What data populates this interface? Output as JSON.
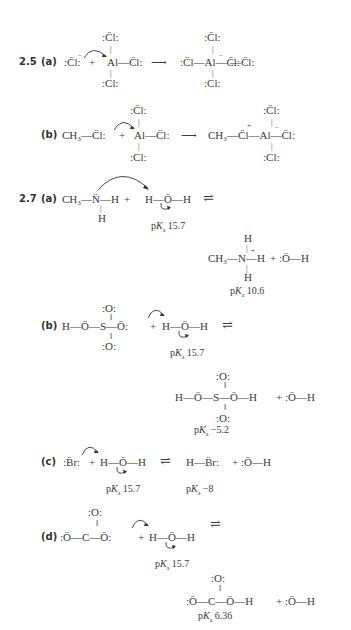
{
  "problems": [
    {
      "number": "2.5",
      "parts": [
        {
          "label": "(a)",
          "reactants": ":Cl:⁻ + AlCl₃",
          "line_left": ":C̈l:",
          "al_top": ":C̈l:",
          "al_center": "Al—C̈l:",
          "al_bottom": ":Cl:",
          "product_left": ":C̈l—Al—C̈l:",
          "product_top": ":C̈l:",
          "product_bottom": ":Cl:",
          "arrow": "⟶"
        },
        {
          "label": "(b)",
          "left": "CH₃—C̈l:",
          "plus": "+",
          "al_top": ":C̈l:",
          "al_center": "Al—C̈l:",
          "al_bottom": ":Cl:",
          "arrow": "⟶",
          "product": "CH₃—C̈l—Al—C̈l:",
          "product_top": ":C̈l:",
          "product_bottom": ":Cl:"
        }
      ]
    },
    {
      "number": "2.7",
      "parts": [
        {
          "label": "(a)",
          "reactant1": "CH₃—N̈—H",
          "reactant1_below": "H",
          "plus": "+",
          "reactant2": "H—Ö—H",
          "equilibrium": "⇌",
          "pka_reactant": "15.7",
          "product1_top": "H",
          "product1": "CH₃—N—H",
          "product1_below": "H",
          "product2": "+ :Ö—H",
          "pka_product": "10.6"
        },
        {
          "label": "(b)",
          "reactant1": "H—Ö—S—Ö:",
          "reactant1_top": ":O:",
          "reactant1_bottom": ":O:",
          "plus": "+",
          "reactant2": "H—Ö—H",
          "equilibrium": "⇌",
          "pka_reactant": "15.7",
          "product1_top": ":O:",
          "product1": "H—Ö—S—Ö—H",
          "product1_bottom": ":O:",
          "product2": "+ :Ö—H",
          "pka_product": "−5.2"
        },
        {
          "label": "(c)",
          "reactant1": ":B̈r:",
          "plus": "+",
          "reactant2": "H—Ö—H",
          "equilibrium": "⇌",
          "product1": "H—B̈r:",
          "product2": "+ :Ö—H",
          "pka_reactant": "15.7",
          "pka_product": "−8"
        },
        {
          "label": "(d)",
          "reactant1_top": ":O:",
          "reactant1": ":Ö—C—Ö:",
          "plus": "+",
          "reactant2": "H—Ö—H",
          "equilibrium": "⇌",
          "pka_reactant": "15.7",
          "product1_top": ":O:",
          "product1": ":Ö—C—Ö—H",
          "product2": "+ :Ö—H",
          "pka_product": "6.36"
        }
      ]
    }
  ],
  "pka_prefix": "p",
  "pka_k": "K",
  "pka_sub": "a"
}
